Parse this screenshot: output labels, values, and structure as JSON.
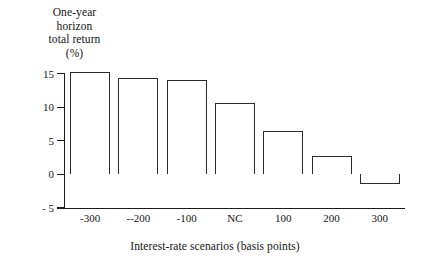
{
  "chart_data": {
    "type": "bar",
    "title": "",
    "categories": [
      "-300",
      "--200",
      "-100",
      "NC",
      "100",
      "200",
      "300"
    ],
    "values": [
      15.2,
      14.3,
      14.0,
      10.6,
      6.5,
      2.8,
      -1.5
    ],
    "xlabel": "Interest-rate scenarios (basis points)",
    "ylabel": "One-year horizon total return (%)",
    "ylabel_lines": [
      "One-year",
      "horizon",
      "total return",
      "(%)"
    ],
    "ylim": [
      -5,
      15
    ],
    "yticks": [
      15,
      10,
      5,
      0,
      -5
    ],
    "ytick_labels": [
      "15",
      "10",
      "5",
      "0",
      "- 5"
    ],
    "grid": false,
    "legend": false,
    "bar_style": {
      "fill": "#ffffff",
      "edge": "#2a2a2a"
    }
  },
  "axis": {
    "y_axis_color": "#1b1b1b",
    "x_axis_color": "#1b1b1b"
  }
}
